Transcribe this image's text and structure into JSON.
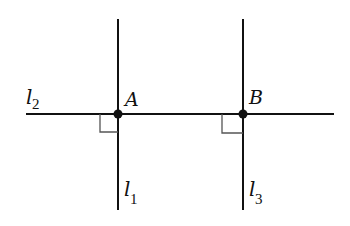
{
  "diagram": {
    "type": "geometry-perpendicular-lines",
    "colors": {
      "line": "#111111",
      "marker": "#555555",
      "background": "#ffffff"
    },
    "lines": [
      {
        "id": "l1",
        "label": "l",
        "subscript": "1",
        "orientation": "vertical",
        "x": 118,
        "y1": 19,
        "y2": 210
      },
      {
        "id": "l2",
        "label": "l",
        "subscript": "2",
        "orientation": "horizontal",
        "y": 114,
        "x1": 26,
        "x2": 334
      },
      {
        "id": "l3",
        "label": "l",
        "subscript": "3",
        "orientation": "vertical",
        "x": 243,
        "y1": 19,
        "y2": 210
      }
    ],
    "points": [
      {
        "id": "A",
        "label": "A",
        "x": 118,
        "y": 114
      },
      {
        "id": "B",
        "label": "B",
        "x": 243,
        "y": 114
      }
    ],
    "right_angles": [
      {
        "at": "A",
        "quadrant": "lower-left"
      },
      {
        "at": "B",
        "quadrant": "lower-left"
      }
    ],
    "relations": [
      "l1 ⊥ l2 at A",
      "l3 ⊥ l2 at B"
    ]
  }
}
